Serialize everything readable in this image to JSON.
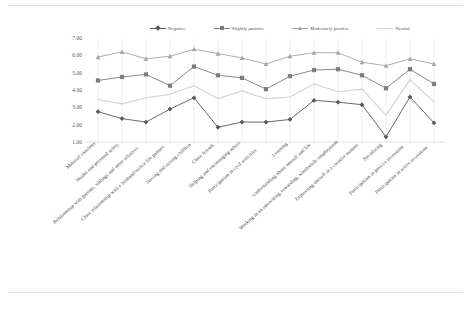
{
  "chart_data": {
    "type": "line",
    "title": "",
    "xlabel": "",
    "ylabel": "",
    "ylim": [
      1.0,
      7.0
    ],
    "ytick_step": 1.0,
    "ytick_labels": [
      "7.00",
      "6.00",
      "5.00",
      "4.00",
      "3.00",
      "2.00",
      "1.00"
    ],
    "ytick_values": [
      7.0,
      6.0,
      5.0,
      4.0,
      3.0,
      2.0,
      1.0
    ],
    "grid": "vertical-only",
    "legend_position": "top-center",
    "categories": [
      "Material comforts",
      "Health and personal safety",
      "Relationship with parents, siblings and other relatives",
      "Close relationship with a husband/wife/a life partner",
      "Having and raising children",
      "Close friends",
      "Helping and encouraging others",
      "Participation in civil activities",
      "Learning",
      "Understanding about oneself and life",
      "Working in an interesting, rewarding, worthwhile employment",
      "Expressing oneself in a creative manner",
      "Socializing",
      "Participation in passive recreation",
      "Participation in active recreation"
    ],
    "series": [
      {
        "name": "Negative",
        "color": "#595959",
        "marker": "diamond",
        "values": [
          2.75,
          2.35,
          2.15,
          2.9,
          3.55,
          1.85,
          2.15,
          2.15,
          2.3,
          3.4,
          3.3,
          3.15,
          1.3,
          3.6,
          2.1
        ]
      },
      {
        "name": "Slightly positive",
        "color": "#7c7c7c",
        "marker": "square",
        "values": [
          4.55,
          4.75,
          4.9,
          4.25,
          5.35,
          4.85,
          4.7,
          4.05,
          4.8,
          5.15,
          5.2,
          4.85,
          4.1,
          5.2,
          4.35
        ]
      },
      {
        "name": "Moderately positive",
        "color": "#a6a6a6",
        "marker": "triangle",
        "values": [
          5.9,
          6.2,
          5.8,
          5.95,
          6.35,
          6.1,
          5.85,
          5.5,
          5.95,
          6.15,
          6.15,
          5.6,
          5.4,
          5.8,
          5.5
        ]
      },
      {
        "name": "Neutral",
        "color": "#d3d3d3",
        "marker": "none",
        "values": [
          3.45,
          3.2,
          3.55,
          3.75,
          4.25,
          3.5,
          3.95,
          3.5,
          3.6,
          4.35,
          3.9,
          4.05,
          2.55,
          4.6,
          3.3
        ]
      }
    ]
  },
  "legend": {
    "items": [
      {
        "label": "Negative"
      },
      {
        "label": "Slightly positive"
      },
      {
        "label": "Moderately positive"
      },
      {
        "label": "Neutral"
      }
    ]
  }
}
